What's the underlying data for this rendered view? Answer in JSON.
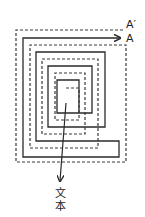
{
  "diagram": {
    "type": "double-spiral",
    "labels": {
      "solid_end": "A",
      "dashed_end": "A′",
      "center_output": "文本",
      "center_output_line1": "文",
      "center_output_line2": "本"
    },
    "colors": {
      "line": "#2a2a2a",
      "background": "#ffffff"
    },
    "spirals": {
      "solid": [
        {
          "x": 23,
          "y": 38,
          "right": 119,
          "bottom": 157
        },
        {
          "x": 36,
          "y": 52,
          "right": 105,
          "bottom": 141
        },
        {
          "x": 48,
          "y": 66,
          "right": 92,
          "bottom": 127
        },
        {
          "x": 57,
          "y": 80,
          "right": 79,
          "bottom": 113
        }
      ],
      "dashed": [
        {
          "x": 16,
          "y": 30,
          "right": 126,
          "bottom": 162
        },
        {
          "x": 30,
          "y": 45,
          "right": 112,
          "bottom": 148
        },
        {
          "x": 42,
          "y": 59,
          "right": 98,
          "bottom": 134
        },
        {
          "x": 55,
          "y": 73,
          "right": 85,
          "bottom": 120
        },
        {
          "x": 66,
          "y": 88,
          "right": 79,
          "bottom": 120
        }
      ]
    },
    "output_arrow": {
      "from": [
        66,
        103
      ],
      "to": [
        60,
        182
      ]
    }
  }
}
